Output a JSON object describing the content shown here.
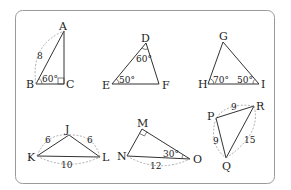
{
  "figure": {
    "frame": {
      "stroke": "#9a9a9a"
    },
    "triangles": [
      {
        "id": "ABC",
        "vertices": {
          "A": "A",
          "B": "B",
          "C": "C"
        },
        "side_labels": {
          "AB": "8"
        },
        "angle_labels": {
          "B": "60°"
        },
        "right_angle_at": "C"
      },
      {
        "id": "DEF",
        "vertices": {
          "D": "D",
          "E": "E",
          "F": "F"
        },
        "angle_labels": {
          "D": "60°",
          "E": "50°"
        }
      },
      {
        "id": "GHI",
        "vertices": {
          "G": "G",
          "H": "H",
          "I": "I"
        },
        "angle_labels": {
          "H": "70°",
          "I": "50°"
        }
      },
      {
        "id": "JKL",
        "vertices": {
          "J": "J",
          "K": "K",
          "L": "L"
        },
        "side_labels": {
          "KJ": "6",
          "JL": "6",
          "KL": "10"
        }
      },
      {
        "id": "MNO",
        "vertices": {
          "M": "M",
          "N": "N",
          "O": "O"
        },
        "side_labels": {
          "NO": "12"
        },
        "angle_labels": {
          "O": "30°"
        },
        "right_angle_at": "M"
      },
      {
        "id": "PQR",
        "vertices": {
          "P": "P",
          "Q": "Q",
          "R": "R"
        },
        "side_labels": {
          "PR": "9",
          "PQ": "9",
          "QR": "15"
        }
      }
    ]
  }
}
